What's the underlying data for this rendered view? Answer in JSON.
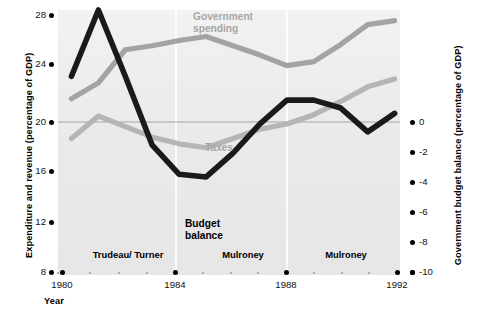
{
  "chart_data": {
    "type": "line",
    "title": "",
    "xlabel": "Year",
    "ylabel": "Expenditure and revenue (percentage of GDP)",
    "ylabel_right": "Government budget balance (percentage of GDP)",
    "x": [
      1980,
      1981,
      1982,
      1983,
      1984,
      1985,
      1986,
      1987,
      1988,
      1989,
      1990,
      1991,
      1992
    ],
    "xlim": [
      1979.5,
      1992.2
    ],
    "ylim": [
      8,
      28
    ],
    "ylim_right": [
      -10,
      0
    ],
    "grid": "vertical-faint",
    "legend": "inline-annotations",
    "xticks_major": [
      "1980",
      "1984",
      "1988",
      "1992"
    ],
    "yticks_left": [
      "28",
      "24",
      "20",
      "16",
      "12",
      "8"
    ],
    "yticks_right": [
      "0",
      "-2",
      "-4",
      "-6",
      "-8",
      "-10"
    ],
    "series": [
      {
        "name": "Government spending",
        "axis": "left",
        "color": "#a3a3a3",
        "values": [
          21.3,
          22.5,
          25.0,
          25.3,
          25.7,
          26.0,
          25.3,
          24.6,
          23.8,
          24.1,
          25.4,
          26.9,
          27.2
        ]
      },
      {
        "name": "Taxes",
        "axis": "left",
        "color": "#b5b5b5",
        "values": [
          18.3,
          20.0,
          19.2,
          18.4,
          17.9,
          17.6,
          18.3,
          19.0,
          19.4,
          20.1,
          21.1,
          22.2,
          22.8
        ]
      },
      {
        "name": "Budget balance",
        "axis": "right",
        "color": "#1a1a1a",
        "values": [
          -2.5,
          0.0,
          -2.5,
          -5.1,
          -6.2,
          -6.3,
          -5.4,
          -4.3,
          -3.4,
          -3.4,
          -3.7,
          -4.6,
          -3.9
        ]
      }
    ],
    "annotations": [
      {
        "text": "Government\nspending",
        "color": "#a6a6a6"
      },
      {
        "text": "Taxes",
        "color": "#a6a6a6"
      },
      {
        "text": "Budget\nbalance",
        "color": "#000000"
      }
    ],
    "eras": [
      {
        "label": "Trudeau/\nTurner",
        "start": 1980,
        "end": 1984
      },
      {
        "label": "Mulroney",
        "start": 1984,
        "end": 1988
      },
      {
        "label": "Mulroney",
        "start": 1988,
        "end": 1992
      }
    ]
  },
  "axes": {
    "left_title": "Expenditure and revenue (percentage of GDP)",
    "right_title": "Government budget balance (percentage of GDP)",
    "x_title": "Year",
    "left_ticks": [
      {
        "label": "28",
        "y": 15
      },
      {
        "label": "24",
        "y": 64
      },
      {
        "label": "20",
        "y": 122
      },
      {
        "label": "16",
        "y": 171
      },
      {
        "label": "12",
        "y": 222
      },
      {
        "label": "8",
        "y": 272
      }
    ],
    "right_ticks": [
      {
        "label": "0",
        "y": 122
      },
      {
        "label": "-2",
        "y": 152
      },
      {
        "label": "-4",
        "y": 182
      },
      {
        "label": "-6",
        "y": 212
      },
      {
        "label": "-8",
        "y": 242
      },
      {
        "label": "-10",
        "y": 272
      }
    ],
    "x_ticks": [
      {
        "label": "1980",
        "x": 62
      },
      {
        "label": "1984",
        "x": 175
      },
      {
        "label": "1988",
        "x": 286
      },
      {
        "label": "1992",
        "x": 397
      }
    ]
  },
  "series_labels": {
    "spending": "Government\nspending",
    "taxes": "Taxes",
    "budget": "Budget\nbalance"
  },
  "era_labels": {
    "first": "Trudeau/\nTurner",
    "second": "Mulroney",
    "third": "Mulroney"
  }
}
